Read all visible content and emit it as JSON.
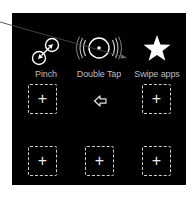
{
  "actions": [
    {
      "label": "Pinch",
      "icon": "pinch-icon"
    },
    {
      "label": "Double Tap",
      "icon": "double-tap-icon"
    },
    {
      "label": "Swipe apps",
      "icon": "star-icon"
    }
  ],
  "slots": {
    "empty_symbol": "+",
    "count": 5
  },
  "back": {
    "icon": "back-arrow-icon"
  },
  "colors": {
    "panel_bg": "#000000",
    "page_bg": "#ffffff",
    "label": "#bdbdbd",
    "icon": "#ffffff",
    "dashed_border": "#cfcfcf",
    "connector": "#555555"
  }
}
